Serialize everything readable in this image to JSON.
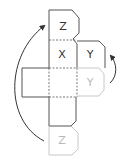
{
  "diagram": {
    "labels": {
      "top_tab": "Z",
      "center_top": "X",
      "right_tab_dark": "Y",
      "right_tab_light": "Y",
      "bottom_tab": "Z"
    },
    "colors": {
      "dark_stroke": "#555555",
      "light_stroke": "#c8c8c8",
      "dark_text": "#333333",
      "light_text": "#b8b8b8",
      "arrow": "#333333"
    }
  }
}
